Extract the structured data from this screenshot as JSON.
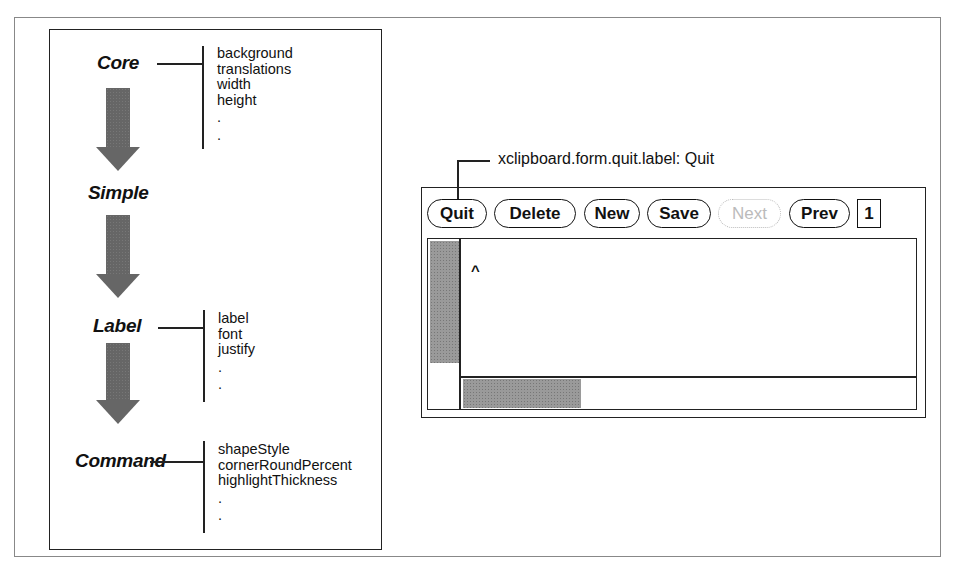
{
  "diagram": {
    "hierarchy": [
      {
        "class": "Core",
        "resources": [
          "background",
          "translations",
          "width",
          "height",
          ".",
          "."
        ]
      },
      {
        "class": "Simple",
        "resources": []
      },
      {
        "class": "Label",
        "resources": [
          "label",
          "font",
          "justify",
          ".",
          "."
        ]
      },
      {
        "class": "Command",
        "resources": [
          "shapeStyle",
          "cornerRoundPercent",
          "highlightThickness",
          ".",
          "."
        ]
      }
    ]
  },
  "window": {
    "callout": "xclipboard.form.quit.label: Quit",
    "buttons": [
      {
        "label": "Quit",
        "enabled": true
      },
      {
        "label": "Delete",
        "enabled": true
      },
      {
        "label": "New",
        "enabled": true
      },
      {
        "label": "Save",
        "enabled": true
      },
      {
        "label": "Next",
        "enabled": false
      },
      {
        "label": "Prev",
        "enabled": true
      }
    ],
    "page_number": "1",
    "text_content": "^"
  },
  "colors": {
    "arrow": "#666666",
    "scrollbar_thumb": "#9a9a9a",
    "disabled": "#bbbbbb"
  }
}
